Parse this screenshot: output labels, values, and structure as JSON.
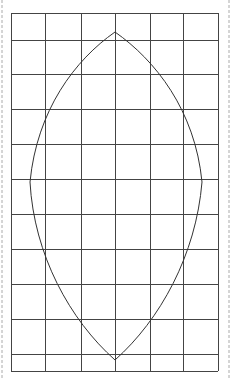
{
  "diagram": {
    "type": "grid-with-lens-shape",
    "grid": {
      "columns": 6,
      "rows": 11,
      "x_lines": [
        11,
        45,
        81,
        115,
        150,
        183,
        218
      ],
      "y_lines": [
        13,
        40,
        74,
        109,
        144,
        179,
        214,
        249,
        284,
        319,
        354,
        371
      ],
      "stroke": "#444444"
    },
    "shape": {
      "name": "vesica-lens",
      "top_apex": [
        115,
        32
      ],
      "bottom_apex": [
        115,
        360
      ],
      "left_extreme": [
        30,
        182
      ],
      "right_extreme": [
        202,
        182
      ],
      "stroke": "#333333"
    },
    "border": {
      "style": "dashed",
      "left_x": 2,
      "right_x": 229,
      "color": "#aaaaaa"
    }
  }
}
